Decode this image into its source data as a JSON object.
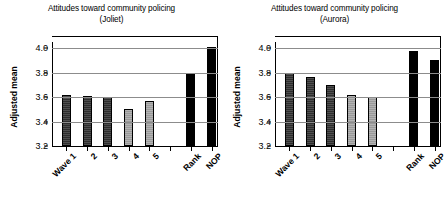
{
  "figure": {
    "ylabel": "Adjusted mean",
    "ytick_labels": [
      "4.0",
      "3.8",
      "3.6",
      "3.4",
      "3.2"
    ]
  },
  "chart_data": [
    {
      "type": "bar",
      "title": "Attitudes toward community policing",
      "subtitle": "(Joliet)",
      "xlabel": "",
      "ylabel": "Adjusted mean",
      "ylim": [
        3.2,
        4.05
      ],
      "yticks": [
        3.2,
        3.4,
        3.6,
        3.8,
        4.0
      ],
      "grid": true,
      "legend": "none",
      "categories": [
        "Wave 1",
        "2",
        "3",
        "4",
        "5",
        "Rank",
        "NOP"
      ],
      "values": [
        3.62,
        3.61,
        3.6,
        3.5,
        3.57,
        3.79,
        4.01
      ],
      "bar_styles": [
        "dark",
        "dark",
        "dark",
        "light",
        "light",
        "black",
        "black"
      ],
      "slot_positions": [
        0,
        1,
        2,
        3,
        4,
        6,
        7
      ],
      "slot_count": 8
    },
    {
      "type": "bar",
      "title": "Attitudes toward community policing",
      "subtitle": "(Aurora)",
      "xlabel": "",
      "ylabel": "Adjusted mean",
      "ylim": [
        3.2,
        4.05
      ],
      "yticks": [
        3.2,
        3.4,
        3.6,
        3.8,
        4.0
      ],
      "grid": true,
      "legend": "none",
      "categories": [
        "Wave 1",
        "2",
        "3",
        "4",
        "5",
        "Rank",
        "NOP"
      ],
      "values": [
        3.8,
        3.76,
        3.7,
        3.62,
        3.6,
        3.98,
        3.9
      ],
      "bar_styles": [
        "dark",
        "dark",
        "dark",
        "light",
        "light",
        "black",
        "black"
      ],
      "slot_positions": [
        0,
        1,
        2,
        3,
        4,
        6,
        7
      ],
      "slot_count": 8
    }
  ]
}
